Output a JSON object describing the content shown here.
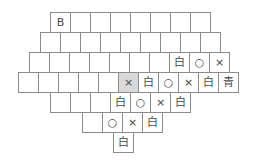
{
  "board": {
    "highlight_color": "#d9d9d9",
    "rows": [
      {
        "left": 50,
        "top": 12,
        "cells": [
          "B",
          "",
          "",
          "",
          "",
          "",
          "",
          ""
        ]
      },
      {
        "left": 40,
        "top": 32,
        "cells": [
          "",
          "",
          "",
          "",
          "",
          "",
          "",
          "",
          ""
        ]
      },
      {
        "left": 29,
        "top": 52,
        "cells": [
          "",
          "",
          "",
          "",
          "",
          "",
          "",
          "白",
          "○",
          "×"
        ]
      },
      {
        "left": 18,
        "top": 72,
        "cells": [
          "",
          "",
          "",
          "",
          "",
          "×",
          "白",
          "○",
          "×",
          "白",
          "青"
        ],
        "highlight_index": 5
      },
      {
        "left": 50,
        "top": 92,
        "cells": [
          "",
          "",
          "",
          "白",
          "○",
          "×",
          "白"
        ]
      },
      {
        "left": 82,
        "top": 112,
        "cells": [
          "",
          "○",
          "×",
          "白"
        ]
      },
      {
        "left": 113,
        "top": 132,
        "cells": [
          "白"
        ]
      }
    ]
  }
}
